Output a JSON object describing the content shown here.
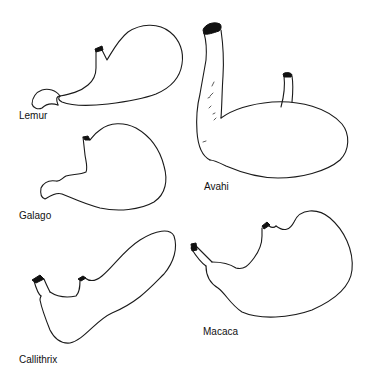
{
  "figure": {
    "type": "comparative anatomy line drawing",
    "specimens": [
      {
        "id": "lemur",
        "label": "Lemur"
      },
      {
        "id": "avahi",
        "label": "Avahi"
      },
      {
        "id": "galago",
        "label": "Galago"
      },
      {
        "id": "callithrix",
        "label": "Callithrix"
      },
      {
        "id": "macaca",
        "label": "Macaca"
      }
    ]
  },
  "colors": {
    "background": "#ffffff",
    "stroke": "#1a1a1a"
  }
}
